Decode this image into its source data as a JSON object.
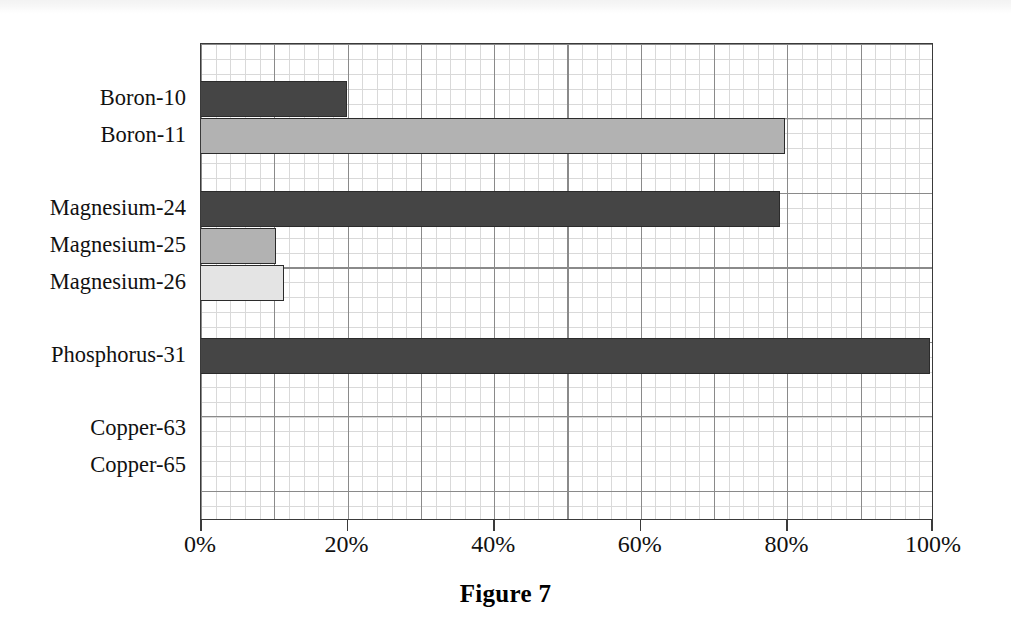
{
  "figure": {
    "caption": "Figure 7",
    "ghost_text": ""
  },
  "chart_data": {
    "type": "bar",
    "orientation": "horizontal",
    "title": "Figure 7",
    "xlabel": "",
    "ylabel": "",
    "xlim": [
      0,
      100
    ],
    "x_tick_labels": [
      "0%",
      "20%",
      "40%",
      "60%",
      "80%",
      "100%"
    ],
    "x_tick_values": [
      0,
      20,
      40,
      60,
      80,
      100
    ],
    "grid": true,
    "grid_minor": true,
    "legend": null,
    "categories": [
      "Boron-10",
      "Boron-11",
      "Magnesium-24",
      "Magnesium-25",
      "Magnesium-26",
      "Phosphorus-31",
      "Copper-63",
      "Copper-65"
    ],
    "values": [
      19.9,
      79.7,
      79.0,
      10.2,
      11.3,
      99.5,
      0,
      0
    ],
    "bars": [
      {
        "label": "Boron-10",
        "value": 19.9,
        "color": "#454545",
        "slot": 1
      },
      {
        "label": "Boron-11",
        "value": 79.7,
        "color": "#b2b2b2",
        "slot": 2
      },
      {
        "label": "Magnesium-24",
        "value": 79.0,
        "color": "#454545",
        "slot": 4
      },
      {
        "label": "Magnesium-25",
        "value": 10.2,
        "color": "#b2b2b2",
        "slot": 5
      },
      {
        "label": "Magnesium-26",
        "value": 11.3,
        "color": "#e4e4e4",
        "slot": 6
      },
      {
        "label": "Phosphorus-31",
        "value": 99.5,
        "color": "#454545",
        "slot": 8
      },
      {
        "label": "Copper-63",
        "value": 0,
        "color": "#b2b2b2",
        "slot": 10
      },
      {
        "label": "Copper-65",
        "value": 0,
        "color": "#e4e4e4",
        "slot": 11
      }
    ],
    "colors": {
      "dark": "#454545",
      "medium": "#b2b2b2",
      "light": "#e4e4e4",
      "axis": "#3a3a3a",
      "grid_major": "#8a8a8a",
      "grid_minor": "#d9d9d9",
      "background": "#ffffff"
    }
  }
}
